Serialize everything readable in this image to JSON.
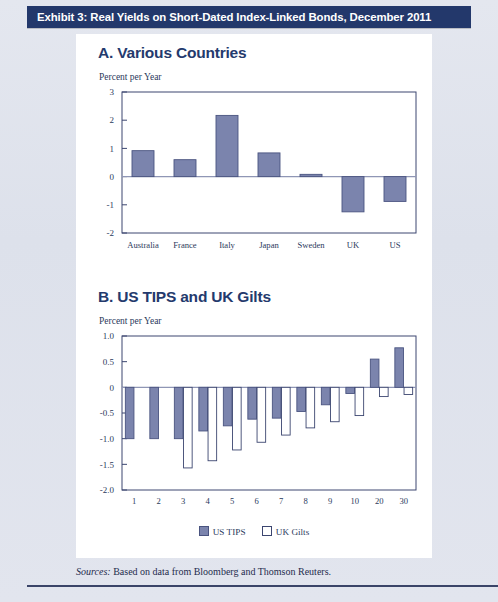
{
  "exhibit": {
    "title": "Exhibit 3: Real Yields on Short-Dated Index-Linked Bonds, December 2011",
    "bar_color": "#23386b"
  },
  "panel_a": {
    "heading": "A. Various Countries",
    "axis_title": "Percent per Year"
  },
  "panel_b": {
    "heading": "B. US TIPS and UK Gilts",
    "axis_title": "Percent per Year"
  },
  "legend": {
    "items": [
      {
        "label": "US TIPS",
        "swatch": "filled",
        "color": "#7b84ad"
      },
      {
        "label": "UK Gilts",
        "swatch": "hollow",
        "color": "#ffffff"
      }
    ]
  },
  "sources": {
    "label": "Sources:",
    "text": "Based on data from Bloomberg and Thomson Reuters."
  },
  "chart_data": [
    {
      "type": "bar",
      "id": "panel-a",
      "title": "A. Various Countries",
      "xlabel": "",
      "ylabel": "Percent per Year",
      "ylim": [
        -2,
        3
      ],
      "yticks": [
        3,
        2,
        1,
        0,
        -1,
        -2
      ],
      "ytick_labels": [
        "3",
        "2",
        "1",
        "0",
        "-1",
        "-2"
      ],
      "grid": false,
      "legend_position": "none",
      "bar_color": "#7b84ad",
      "bar_edge": "#4a5480",
      "categories": [
        "Australia",
        "France",
        "Italy",
        "Japan",
        "Sweden",
        "UK",
        "US"
      ],
      "values": [
        0.92,
        0.6,
        2.17,
        0.84,
        0.08,
        -1.25,
        -0.88
      ]
    },
    {
      "type": "bar",
      "id": "panel-b",
      "title": "B. US TIPS and UK Gilts",
      "xlabel": "",
      "ylabel": "Percent per Year",
      "ylim": [
        -2.0,
        1.0
      ],
      "yticks": [
        1.0,
        0.5,
        0,
        -0.5,
        -1.0,
        -1.5,
        -2.0
      ],
      "ytick_labels": [
        "1.0",
        "0.5",
        "0",
        "-0.5",
        "-1.0",
        "-1.5",
        "-2.0"
      ],
      "grid": false,
      "legend_position": "bottom",
      "categories": [
        "1",
        "2",
        "3",
        "4",
        "5",
        "6",
        "7",
        "8",
        "9",
        "10",
        "20",
        "30"
      ],
      "series": [
        {
          "name": "US TIPS",
          "color": "#7b84ad",
          "edge": "#4a5480",
          "values": [
            -1.0,
            -1.0,
            -1.0,
            -0.85,
            -0.75,
            -0.62,
            -0.6,
            -0.47,
            -0.34,
            -0.12,
            0.55,
            0.77
          ]
        },
        {
          "name": "UK Gilts",
          "color": "#ffffff",
          "edge": "#3c4670",
          "values": [
            0.0,
            0.0,
            -1.57,
            -1.43,
            -1.22,
            -1.07,
            -0.93,
            -0.79,
            -0.67,
            -0.55,
            -0.18,
            -0.14
          ]
        }
      ]
    }
  ]
}
